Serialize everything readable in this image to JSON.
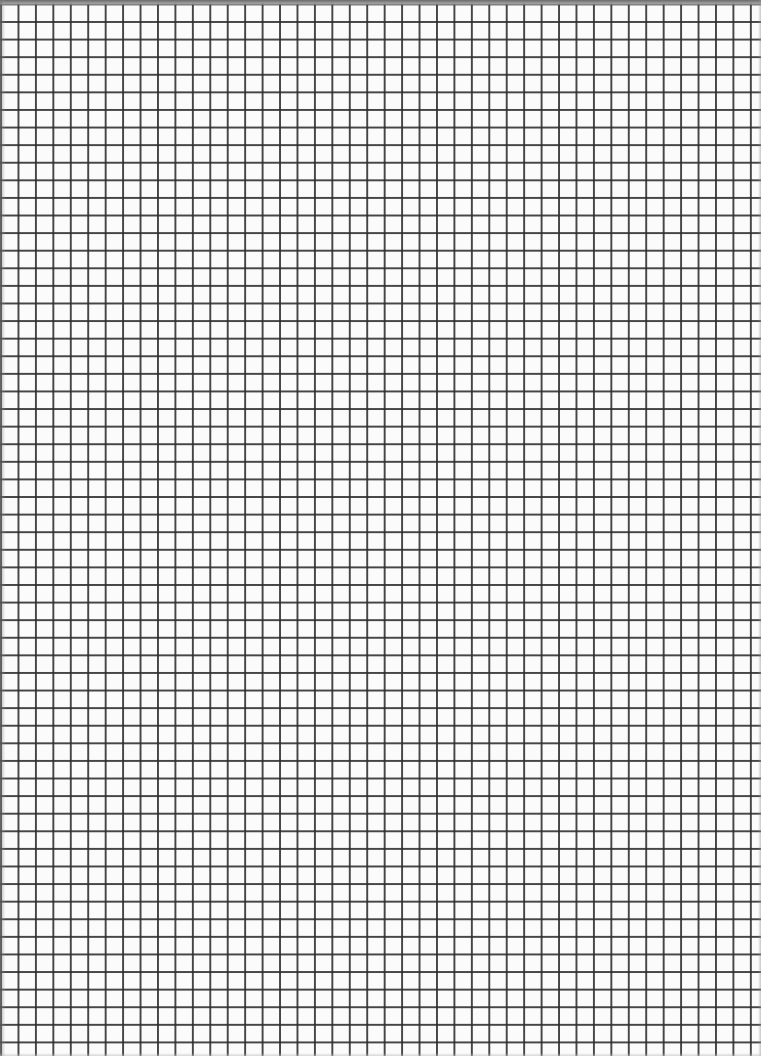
{
  "document": {
    "type": "graph-paper",
    "grid": {
      "cell_width_px": 17.45,
      "cell_height_px": 17.6,
      "line_color": "#2d2d2d",
      "background_color": "#fbfbfb",
      "columns_visible": 43,
      "rows_visible": 59
    },
    "edges": {
      "top_band_color": "#6a6a6a"
    }
  }
}
